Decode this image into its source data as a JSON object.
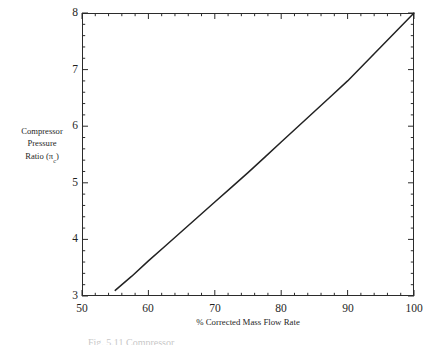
{
  "figure": {
    "background_color": "#ffffff",
    "line_color": "#222222",
    "axis_color": "#2b2b2b",
    "caption_partial": "Fig. 5.11   Compressor"
  },
  "axes": {
    "y_title_lines": [
      "Compressor",
      "Pressure",
      "Ratio ("
    ],
    "y_title_symbol": "π",
    "y_title_subscript": "c",
    "y_title_close": ")",
    "x_title": "% Corrected Mass Flow Rate",
    "y_tick_labels": [
      "3",
      "4",
      "5",
      "6",
      "7",
      "8"
    ],
    "x_tick_labels": [
      "50",
      "60",
      "70",
      "80",
      "90",
      "100"
    ]
  },
  "chart_data": {
    "type": "line",
    "title": "",
    "xlabel": "% Corrected Mass Flow Rate",
    "ylabel": "Compressor Pressure Ratio (πc)",
    "xlim": [
      50,
      100
    ],
    "ylim": [
      3,
      8
    ],
    "x_major_ticks": [
      50,
      60,
      70,
      80,
      90,
      100
    ],
    "y_major_ticks": [
      3,
      4,
      5,
      6,
      7,
      8
    ],
    "x_minor_tick_interval": 2,
    "y_minor_tick_interval": 0.2,
    "grid": false,
    "legend": false,
    "series": [
      {
        "name": "Compressor operating line",
        "x": [
          55,
          57.5,
          60,
          62.5,
          65,
          67.5,
          70,
          72.5,
          75,
          77.5,
          80,
          82.5,
          85,
          87.5,
          90,
          92.5,
          95,
          97.5,
          100
        ],
        "y": [
          3.1,
          3.35,
          3.62,
          3.88,
          4.14,
          4.4,
          4.66,
          4.92,
          5.18,
          5.45,
          5.72,
          5.99,
          6.26,
          6.53,
          6.8,
          7.1,
          7.4,
          7.7,
          8.0
        ]
      }
    ]
  }
}
